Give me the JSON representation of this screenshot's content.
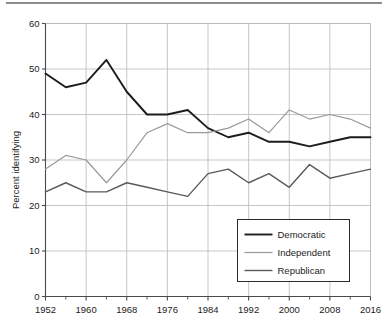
{
  "chart_data": {
    "type": "line",
    "title": "",
    "xlabel": "",
    "ylabel": "Percent identifying",
    "xlim": [
      1952,
      2016
    ],
    "ylim": [
      0,
      60
    ],
    "ytick_values": [
      0,
      10,
      20,
      30,
      40,
      50,
      60
    ],
    "ytick_labels": [
      "0",
      "10",
      "20",
      "30",
      "40",
      "50",
      "60"
    ],
    "xtick_values": [
      1952,
      1960,
      1968,
      1976,
      1984,
      1992,
      2000,
      2008,
      2016
    ],
    "xtick_labels": [
      "1952",
      "1960",
      "1968",
      "1976",
      "1984",
      "1992",
      "2000",
      "2008",
      "2016"
    ],
    "xtick_minor_values": [
      1956,
      1964,
      1972,
      1980,
      1988,
      1996,
      2004,
      2012
    ],
    "grid": "both",
    "legend_position": "bottom-right",
    "x": [
      1952,
      1956,
      1960,
      1964,
      1968,
      1972,
      1976,
      1980,
      1984,
      1988,
      1992,
      1996,
      2000,
      2004,
      2008,
      2012,
      2016
    ],
    "series": [
      {
        "name": "Democratic",
        "color": "#1c1c1c",
        "width": 1.9,
        "values": [
          49,
          46,
          47,
          52,
          45,
          40,
          40,
          41,
          37,
          35,
          36,
          34,
          34,
          33,
          34,
          35,
          35
        ]
      },
      {
        "name": "Independent",
        "color": "#9a9a9a",
        "width": 1.2,
        "values": [
          28,
          31,
          30,
          25,
          30,
          36,
          38,
          36,
          36,
          37,
          39,
          36,
          41,
          39,
          40,
          39,
          37
        ]
      },
      {
        "name": "Republican",
        "color": "#5a5a5a",
        "width": 1.4,
        "values": [
          23,
          25,
          23,
          23,
          25,
          24,
          23,
          22,
          27,
          28,
          25,
          27,
          24,
          29,
          26,
          27,
          28
        ]
      }
    ]
  },
  "legend": {
    "items": [
      {
        "label": "Democratic"
      },
      {
        "label": "Independent"
      },
      {
        "label": "Republican"
      }
    ]
  },
  "axes": {
    "y_title": "Percent identifying"
  }
}
